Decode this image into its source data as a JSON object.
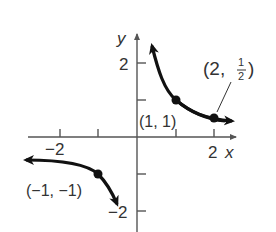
{
  "graph": {
    "function": "y = 1/x",
    "axes": {
      "x_label": "x",
      "y_label": "y"
    },
    "tick_labels": {
      "x_neg2": "−2",
      "x_2": "2",
      "y_2": "2",
      "y_neg2": "−2"
    },
    "points": [
      {
        "label": "(1, 1)",
        "x": 1,
        "y": 1
      },
      {
        "label_prefix": "(2, ",
        "label_num": "1",
        "label_den": "2",
        "label_suffix": ")",
        "x": 2,
        "y": 0.5
      },
      {
        "label": "(−1, −1)",
        "x": -1,
        "y": -1
      }
    ],
    "colors": {
      "axis": "#555555",
      "curve": "#111111",
      "text": "#333333"
    }
  }
}
